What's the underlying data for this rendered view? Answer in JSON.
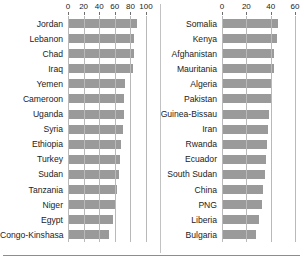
{
  "chart_data": {
    "type": "bar",
    "title": "",
    "orientation": "horizontal",
    "grid": true,
    "legend": "none",
    "panels": [
      {
        "name": "left-panel",
        "xlabel": "",
        "ylabel": "",
        "xlim": [
          0,
          100
        ],
        "ticks": [
          0,
          20,
          40,
          60,
          80,
          100
        ],
        "tick_labels": [
          "0",
          "20",
          "40",
          "60",
          "80",
          "100"
        ],
        "categories": [
          "Jordan",
          "Lebanon",
          "Chad",
          "Iraq",
          "Yemen",
          "Cameroon",
          "Uganda",
          "Syria",
          "Ethiopia",
          "Turkey",
          "Sudan",
          "Tanzania",
          "Niger",
          "Egypt",
          "Congo-Kinshasa"
        ],
        "values": [
          89,
          84,
          84,
          83,
          73,
          72,
          72,
          70,
          68,
          67,
          65,
          63,
          60,
          58,
          52
        ]
      },
      {
        "name": "right-panel",
        "xlabel": "",
        "ylabel": "",
        "xlim": [
          0,
          60
        ],
        "ticks": [
          0,
          20,
          40,
          60
        ],
        "tick_labels": [
          "0",
          "20",
          "40",
          "60"
        ],
        "categories": [
          "Somalia",
          "Kenya",
          "Afghanistan",
          "Mauritania",
          "Algeria",
          "Pakistan",
          "Guinea-Bissau",
          "Iran",
          "Rwanda",
          "Ecuador",
          "South Sudan",
          "China",
          "PNG",
          "Liberia",
          "Bulgaria"
        ],
        "values": [
          46,
          45,
          43,
          43,
          41,
          40,
          39,
          38,
          37,
          36,
          35,
          34,
          33,
          30,
          28
        ]
      }
    ],
    "colors": {
      "bar": "#9a9a9a",
      "grid": "#b9b9b9",
      "text": "#222222",
      "background": "#ffffff"
    }
  }
}
